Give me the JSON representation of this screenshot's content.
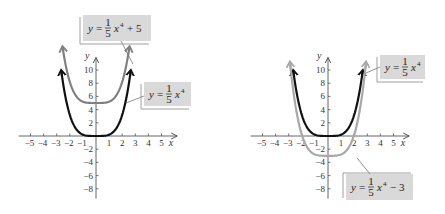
{
  "chart_data": [
    {
      "type": "line",
      "title": "",
      "xlabel": "x",
      "ylabel": "y",
      "xlim": [
        -5,
        5
      ],
      "ylim": [
        -8,
        10
      ],
      "x_ticks": [
        -5,
        -4,
        -3,
        -2,
        -1,
        1,
        2,
        3,
        4,
        5
      ],
      "y_ticks": [
        -8,
        -6,
        -4,
        -2,
        2,
        4,
        6,
        8,
        10
      ],
      "grid": false,
      "series": [
        {
          "name": "y = 1/5 x^4 + 5",
          "function": "0.2*x^4 + 5",
          "color": "#808080",
          "label": {
            "text": "y = (1/5)x⁴ + 5",
            "lhs": "y =",
            "num": "1",
            "den": "5",
            "var": "x",
            "exp": "4",
            "tail": "+ 5"
          }
        },
        {
          "name": "y = 1/5 x^4",
          "function": "0.2*x^4",
          "color": "#111111",
          "label": {
            "text": "y = (1/5)x⁴",
            "lhs": "y =",
            "num": "1",
            "den": "5",
            "var": "x",
            "exp": "4",
            "tail": ""
          }
        }
      ]
    },
    {
      "type": "line",
      "title": "",
      "xlabel": "x",
      "ylabel": "y",
      "xlim": [
        -5,
        5
      ],
      "ylim": [
        -8,
        10
      ],
      "x_ticks": [
        -5,
        -4,
        -3,
        -2,
        -1,
        1,
        2,
        3,
        4,
        5
      ],
      "y_ticks": [
        -8,
        -6,
        -4,
        -2,
        2,
        4,
        6,
        8,
        10
      ],
      "grid": false,
      "series": [
        {
          "name": "y = 1/5 x^4",
          "function": "0.2*x^4",
          "color": "#111111",
          "label": {
            "text": "y = (1/5)x⁴",
            "lhs": "y =",
            "num": "1",
            "den": "5",
            "var": "x",
            "exp": "4",
            "tail": ""
          }
        },
        {
          "name": "y = 1/5 x^4 - 3",
          "function": "0.2*x^4 - 3",
          "color": "#a0a0a0",
          "label": {
            "text": "y = (1/5)x⁴ − 3",
            "lhs": "y =",
            "num": "1",
            "den": "5",
            "var": "x",
            "exp": "4",
            "tail": "− 3"
          }
        }
      ]
    }
  ],
  "axis_labels": {
    "x": "x",
    "y": "y"
  },
  "x_tick_labels": [
    "−5",
    "−4",
    "−3",
    "−2",
    "−1",
    "1",
    "2",
    "3",
    "4",
    "5"
  ],
  "y_tick_labels": [
    "−8",
    "−6",
    "−4",
    "−2",
    "2",
    "4",
    "6",
    "8",
    "10"
  ],
  "colors": {
    "dark_curve": "#111111",
    "gray_curve_1": "#808080",
    "gray_curve_2": "#a8a8a8",
    "label_bg": "#d9d9d9",
    "axis": "#555555"
  }
}
